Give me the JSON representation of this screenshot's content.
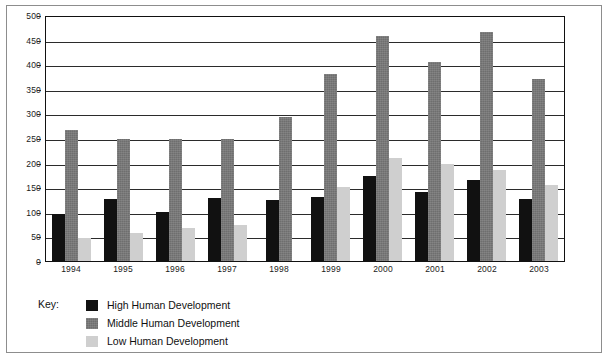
{
  "chart_data": {
    "type": "bar",
    "title": "",
    "subtitle": "",
    "xlabel": "",
    "ylabel": "",
    "ylim": [
      0,
      500
    ],
    "ytick_step": 50,
    "yticks": [
      "500",
      "450",
      "400",
      "350",
      "300",
      "250",
      "200",
      "150",
      "100",
      "50",
      "0"
    ],
    "grid": true,
    "legend_position": "below-left",
    "legend_title": "Key:",
    "categories": [
      "1994",
      "1995",
      "1996",
      "1997",
      "1998",
      "1999",
      "2000",
      "2001",
      "2002",
      "2003"
    ],
    "series": [
      {
        "name": "High Human Development",
        "color": "#111111",
        "values": [
          95,
          126,
          99,
          128,
          125,
          130,
          172,
          141,
          165,
          127
        ]
      },
      {
        "name": "Middle Human Development",
        "color": "#6e6e6e",
        "values": [
          267,
          249,
          249,
          247,
          293,
          380,
          458,
          405,
          465,
          370
        ]
      },
      {
        "name": "Low Human Development",
        "color": "#cfcfcf",
        "values": [
          47,
          57,
          68,
          74,
          0,
          150,
          210,
          197,
          185,
          155
        ]
      }
    ]
  },
  "legend": {
    "title": "Key:",
    "items": [
      {
        "label": "High Human Development",
        "key": "high"
      },
      {
        "label": "Middle Human Development",
        "key": "middle"
      },
      {
        "label": "Low Human Development",
        "key": "low"
      }
    ]
  }
}
